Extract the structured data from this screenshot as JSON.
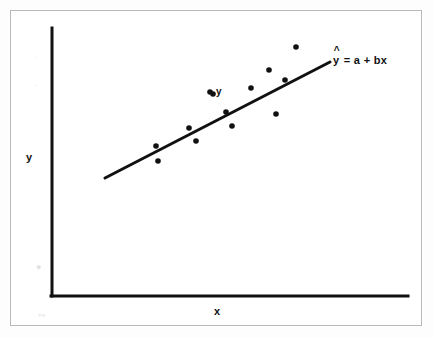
{
  "figure": {
    "background_color": "#ffffff",
    "frame_color": "#b9b9b9",
    "ink_color": "#111111"
  },
  "axes": {
    "y_title": "y",
    "x_title": "x",
    "origin_x": 52,
    "origin_y": 296,
    "y_top": 28,
    "x_right": 408,
    "line_width": 3
  },
  "annotations": {
    "point_label": "y",
    "equation_hat": "^",
    "equation_base": "y",
    "equation_rest": " = a + bx"
  },
  "chart_data": {
    "type": "scatter",
    "title": "",
    "subtitle": "",
    "xlabel": "x",
    "ylabel": "y",
    "grid": false,
    "legend": false,
    "axis_style": "L-shaped unlabeled axes, no tick marks, no tick labels",
    "series": [
      {
        "name": "observations",
        "marker": "filled circle",
        "marker_color": "#111111",
        "marker_size_px": 5,
        "points": [
          {
            "x": 156,
            "y": 146
          },
          {
            "x": 158,
            "y": 161
          },
          {
            "x": 189,
            "y": 128
          },
          {
            "x": 196,
            "y": 141
          },
          {
            "x": 213,
            "y": 94
          },
          {
            "x": 226,
            "y": 112
          },
          {
            "x": 232,
            "y": 126
          },
          {
            "x": 251,
            "y": 88
          },
          {
            "x": 269,
            "y": 70
          },
          {
            "x": 276,
            "y": 114
          },
          {
            "x": 285,
            "y": 80
          },
          {
            "x": 296,
            "y": 47
          }
        ]
      }
    ],
    "fit_line": {
      "name": "least squares regression line",
      "label": "ŷ = a + bx",
      "color": "#111111",
      "width_px": 3,
      "x1": 105,
      "y1": 178,
      "x2": 330,
      "y2": 62
    },
    "labeled_point": {
      "label": "y",
      "x": 210,
      "y": 92,
      "note": "single observed value annotated as y"
    }
  }
}
